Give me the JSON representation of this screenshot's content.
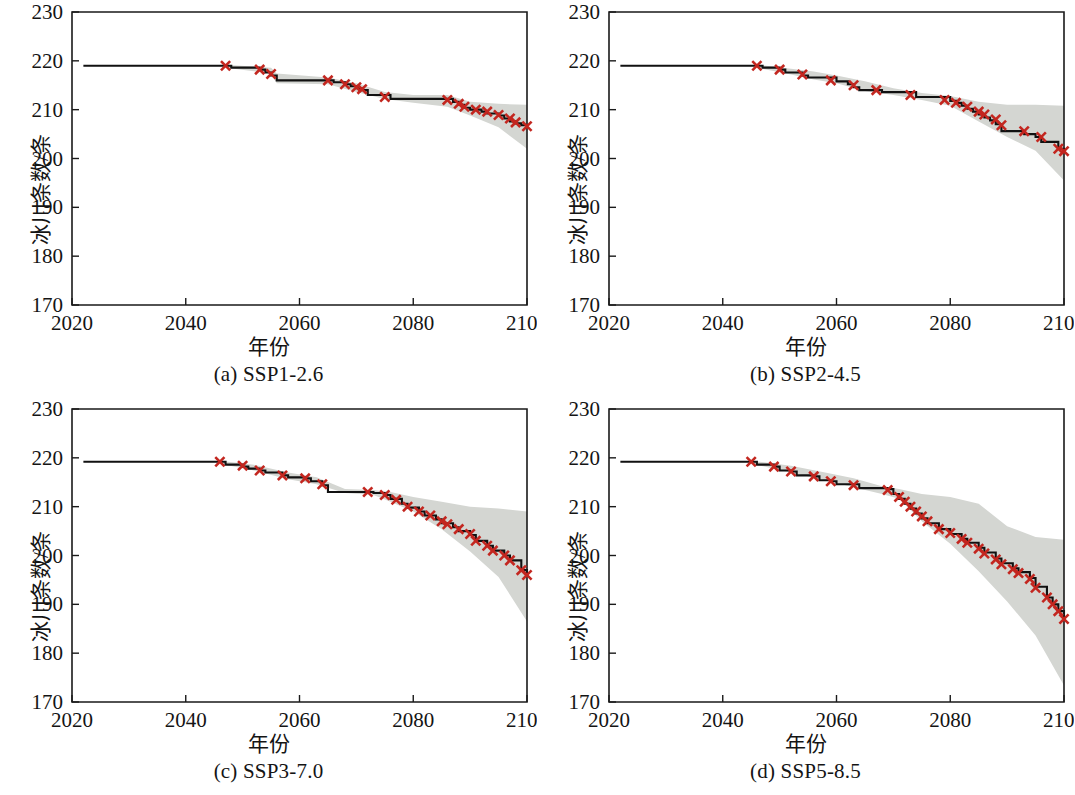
{
  "figure": {
    "background_color": "#ffffff",
    "axis_color": "#1a1a1a",
    "median_line_color": "#111111",
    "marker_color": "#c3261f",
    "band_color": "#d4d6d2",
    "panel_count": 4
  },
  "axes": {
    "xlabel": "年份",
    "ylabel": "冰川条数/条",
    "xlim": [
      2020,
      2100
    ],
    "ylim": [
      170,
      230
    ],
    "xticks": [
      2020,
      2040,
      2060,
      2080,
      2100
    ],
    "xtick_labels": [
      "2020",
      "2040",
      "2060",
      "2080",
      "2100"
    ],
    "yticks": [
      170,
      180,
      190,
      200,
      210,
      220,
      230
    ],
    "ytick_labels": [
      "170",
      "180",
      "190",
      "200",
      "210",
      "220",
      "230"
    ],
    "grid": false,
    "legend": false
  },
  "captions": {
    "a": "(a) SSP1-2.6",
    "b": "(b) SSP2-4.5",
    "c": "(c) SSP3-7.0",
    "d": "(d) SSP5-8.5"
  },
  "chart_data": [
    {
      "type": "line",
      "panel": "a",
      "title": "(a) SSP1-2.6",
      "scenario": "SSP1-2.6",
      "xlabel": "年份",
      "ylabel": "冰川条数/条",
      "xlim": [
        2020,
        2100
      ],
      "ylim": [
        170,
        230
      ],
      "grid": false,
      "legend": false,
      "step": true,
      "series": [
        {
          "name": "median",
          "x": [
            2022,
            2047,
            2048,
            2053,
            2054,
            2055,
            2056,
            2065,
            2066,
            2068,
            2069,
            2070,
            2071,
            2072,
            2075,
            2076,
            2086,
            2087,
            2088,
            2089,
            2090,
            2092,
            2093,
            2095,
            2096,
            2097,
            2098,
            2099,
            2100
          ],
          "y": [
            219,
            219,
            218.6,
            218.2,
            217.6,
            217,
            216,
            216,
            215.6,
            215.2,
            214.8,
            214.4,
            214,
            213,
            213,
            212.2,
            212.2,
            211.6,
            211,
            210.4,
            210,
            209.6,
            209.2,
            208.8,
            208.2,
            207.6,
            207.2,
            206.8,
            206.6
          ]
        },
        {
          "name": "upper",
          "x": [
            2047,
            2055,
            2056,
            2065,
            2070,
            2075,
            2080,
            2086,
            2090,
            2095,
            2100
          ],
          "y": [
            219.2,
            218.6,
            217.4,
            216.6,
            215.4,
            213.6,
            213,
            213,
            211.6,
            211.2,
            211
          ]
        },
        {
          "name": "lower",
          "x": [
            2047,
            2055,
            2056,
            2065,
            2070,
            2075,
            2080,
            2086,
            2090,
            2095,
            2100
          ],
          "y": [
            218.6,
            217.4,
            215.4,
            215.2,
            213.6,
            212.2,
            211.4,
            210.6,
            208.8,
            206.4,
            202
          ]
        }
      ],
      "markers": {
        "x": [
          2047,
          2053,
          2055,
          2065,
          2068,
          2070,
          2071,
          2075,
          2086,
          2088,
          2089,
          2091,
          2093,
          2095,
          2097,
          2098,
          2100
        ],
        "y": [
          219,
          218.2,
          217.3,
          216,
          215.2,
          214.6,
          214.2,
          212.6,
          212,
          211.2,
          210.6,
          210,
          209.6,
          208.9,
          208.2,
          207.4,
          206.6
        ],
        "symbol": "x",
        "color": "#c3261f"
      },
      "endpoint_2100": 206.6
    },
    {
      "type": "line",
      "panel": "b",
      "title": "(b) SSP2-4.5",
      "scenario": "SSP2-4.5",
      "xlabel": "年份",
      "ylabel": "冰川条数/条",
      "xlim": [
        2020,
        2100
      ],
      "ylim": [
        170,
        230
      ],
      "grid": false,
      "legend": false,
      "step": true,
      "series": [
        {
          "name": "median",
          "x": [
            2022,
            2046,
            2047,
            2050,
            2051,
            2054,
            2055,
            2059,
            2060,
            2062,
            2063,
            2064,
            2067,
            2068,
            2073,
            2074,
            2079,
            2080,
            2081,
            2082,
            2083,
            2084,
            2085,
            2086,
            2087,
            2088,
            2089,
            2092,
            2093,
            2095,
            2096,
            2099,
            2100
          ],
          "y": [
            219,
            219,
            218.6,
            218.2,
            217.6,
            217,
            216.6,
            216.6,
            215.8,
            215.2,
            214.6,
            214,
            214,
            213.6,
            213.6,
            212.6,
            212.6,
            211.8,
            211.4,
            210.8,
            210.2,
            209.6,
            209,
            208.4,
            207.8,
            207,
            205.6,
            205.6,
            205,
            204.4,
            203.4,
            202,
            201.5
          ]
        },
        {
          "name": "upper",
          "x": [
            2046,
            2052,
            2056,
            2060,
            2065,
            2070,
            2075,
            2080,
            2085,
            2090,
            2095,
            2100
          ],
          "y": [
            219.2,
            218.4,
            217.8,
            217,
            215.8,
            214.4,
            213.4,
            212.8,
            211.6,
            211,
            211,
            210.8
          ]
        },
        {
          "name": "lower",
          "x": [
            2046,
            2052,
            2056,
            2060,
            2065,
            2070,
            2075,
            2080,
            2085,
            2090,
            2095,
            2100
          ],
          "y": [
            218.6,
            217.2,
            216.2,
            215.4,
            213.8,
            213,
            212,
            210.8,
            207.6,
            204.4,
            201.6,
            195.5
          ]
        }
      ],
      "markers": {
        "x": [
          2046,
          2050,
          2054,
          2059,
          2063,
          2067,
          2073,
          2079,
          2081,
          2083,
          2085,
          2086,
          2088,
          2089,
          2093,
          2096,
          2099,
          2100
        ],
        "y": [
          219,
          218.2,
          217.2,
          216,
          215,
          214,
          213,
          212,
          211.4,
          210.6,
          209.6,
          209,
          208,
          206.8,
          205.6,
          204.4,
          202,
          201.5
        ],
        "symbol": "x",
        "color": "#c3261f"
      },
      "endpoint_2100": 201.5
    },
    {
      "type": "line",
      "panel": "c",
      "title": "(c) SSP3-7.0",
      "scenario": "SSP3-7.0",
      "xlabel": "年份",
      "ylabel": "冰川条数/条",
      "xlim": [
        2020,
        2100
      ],
      "ylim": [
        170,
        230
      ],
      "grid": false,
      "legend": false,
      "step": true,
      "series": [
        {
          "name": "median",
          "x": [
            2022,
            2046,
            2047,
            2050,
            2051,
            2053,
            2054,
            2057,
            2058,
            2061,
            2062,
            2064,
            2065,
            2072,
            2073,
            2075,
            2076,
            2078,
            2079,
            2081,
            2082,
            2084,
            2085,
            2087,
            2088,
            2090,
            2091,
            2093,
            2094,
            2096,
            2097,
            2099,
            2100
          ],
          "y": [
            219.2,
            219.2,
            218.6,
            218.2,
            217.8,
            217.4,
            217,
            216.4,
            216,
            215.8,
            215.2,
            214.4,
            213,
            213,
            212.8,
            212.4,
            211.6,
            210.6,
            209.8,
            209,
            208.2,
            207.4,
            206.6,
            205.8,
            205,
            204.2,
            203,
            202,
            201,
            200,
            199,
            197,
            196
          ]
        },
        {
          "name": "upper",
          "x": [
            2046,
            2052,
            2058,
            2063,
            2068,
            2073,
            2076,
            2080,
            2085,
            2090,
            2095,
            2100
          ],
          "y": [
            219.4,
            218.6,
            217,
            216,
            213.6,
            213.4,
            213,
            212,
            211,
            210,
            209.6,
            209
          ]
        },
        {
          "name": "lower",
          "x": [
            2046,
            2052,
            2058,
            2063,
            2068,
            2073,
            2076,
            2080,
            2085,
            2090,
            2095,
            2100
          ],
          "y": [
            218.8,
            217.4,
            215.6,
            214.6,
            212.8,
            212.4,
            211,
            209,
            205.4,
            200.8,
            195.6,
            186.5
          ]
        }
      ],
      "markers": {
        "x": [
          2046,
          2050,
          2053,
          2057,
          2061,
          2064,
          2072,
          2075,
          2077,
          2079,
          2081,
          2083,
          2085,
          2086,
          2088,
          2090,
          2091,
          2093,
          2094,
          2096,
          2097,
          2099,
          2100
        ],
        "y": [
          219.2,
          218.4,
          217.4,
          216.4,
          215.8,
          214.6,
          213,
          212.4,
          211.4,
          210,
          209,
          208.2,
          207,
          206.4,
          205.4,
          204.4,
          203,
          202,
          201,
          200,
          199,
          197,
          196
        ],
        "symbol": "x",
        "color": "#c3261f"
      },
      "endpoint_2100": 196
    },
    {
      "type": "line",
      "panel": "d",
      "title": "(d) SSP5-8.5",
      "scenario": "SSP5-8.5",
      "xlabel": "年份",
      "ylabel": "冰川条数/条",
      "xlim": [
        2020,
        2100
      ],
      "ylim": [
        170,
        230
      ],
      "grid": false,
      "legend": false,
      "step": true,
      "series": [
        {
          "name": "median",
          "x": [
            2022,
            2045,
            2046,
            2049,
            2050,
            2052,
            2053,
            2056,
            2057,
            2059,
            2060,
            2063,
            2064,
            2069,
            2070,
            2071,
            2072,
            2073,
            2074,
            2075,
            2076,
            2078,
            2079,
            2080,
            2082,
            2083,
            2085,
            2086,
            2088,
            2089,
            2091,
            2092,
            2094,
            2095,
            2097,
            2098,
            2099,
            2100
          ],
          "y": [
            219.2,
            219.2,
            218.6,
            218.2,
            217.4,
            217.2,
            216.4,
            216.2,
            215.4,
            215.2,
            214.6,
            214.6,
            213.8,
            213.6,
            212.6,
            211.6,
            210.6,
            209.6,
            208.6,
            207.6,
            206.6,
            205.4,
            205.4,
            204.4,
            203.4,
            202.6,
            201.6,
            200.6,
            199.4,
            198.4,
            197.4,
            196.6,
            195.4,
            193.6,
            191.4,
            190,
            188.6,
            187
          ]
        },
        {
          "name": "upper",
          "x": [
            2045,
            2052,
            2058,
            2063,
            2068,
            2071,
            2075,
            2080,
            2085,
            2090,
            2095,
            2100
          ],
          "y": [
            219.4,
            218.4,
            217,
            215.8,
            214.2,
            213.6,
            212.6,
            212,
            210.6,
            206,
            203.8,
            203.2
          ]
        },
        {
          "name": "lower",
          "x": [
            2045,
            2052,
            2058,
            2063,
            2068,
            2071,
            2075,
            2080,
            2085,
            2090,
            2095,
            2100
          ],
          "y": [
            218.8,
            217,
            215.4,
            214,
            212.6,
            211.6,
            207,
            202.4,
            196.8,
            190.6,
            183.6,
            173.4
          ]
        }
      ],
      "markers": {
        "x": [
          2045,
          2049,
          2052,
          2056,
          2059,
          2063,
          2069,
          2071,
          2072,
          2073,
          2074,
          2075,
          2076,
          2078,
          2080,
          2082,
          2083,
          2085,
          2086,
          2088,
          2089,
          2091,
          2092,
          2094,
          2095,
          2097,
          2098,
          2099,
          2100
        ],
        "y": [
          219.2,
          218.2,
          217.2,
          216.2,
          215.2,
          214.4,
          213.4,
          212,
          211,
          210,
          209,
          208,
          207,
          205.4,
          204.6,
          203.4,
          202.6,
          201.4,
          200.4,
          199.2,
          198.2,
          197.2,
          196.4,
          195.2,
          193.4,
          191.4,
          190,
          188.6,
          187
        ],
        "symbol": "x",
        "color": "#c3261f"
      },
      "endpoint_2100": 187
    }
  ]
}
